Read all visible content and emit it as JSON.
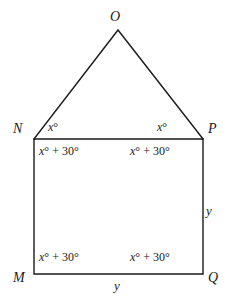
{
  "figure": {
    "type": "geometry-diagram",
    "canvas": {
      "width": 230,
      "height": 302
    },
    "stroke_color": "#1a1a1a",
    "fill_color": "#ffffff",
    "stroke_width": 1.4,
    "points": {
      "O": {
        "x": 118,
        "y": 30
      },
      "N": {
        "x": 34,
        "y": 139
      },
      "P": {
        "x": 203,
        "y": 139
      },
      "Q": {
        "x": 203,
        "y": 274
      },
      "M": {
        "x": 34,
        "y": 274
      }
    },
    "vertex_labels": {
      "O": "O",
      "N": "N",
      "P": "P",
      "M": "M",
      "Q": "Q"
    },
    "angle_labels": {
      "triangle_base_left": {
        "var": "x",
        "deg": "°"
      },
      "triangle_base_right": {
        "var": "x",
        "deg": "°"
      },
      "rect_top_left": {
        "var": "x",
        "rest": "° + 30°"
      },
      "rect_top_right": {
        "var": "x",
        "rest": "° + 30°"
      },
      "rect_bottom_left": {
        "var": "x",
        "rest": "° + 30°"
      },
      "rect_bottom_right": {
        "var": "x",
        "rest": "° + 30°"
      }
    },
    "side_labels": {
      "right_side": "y",
      "bottom_side": "y"
    }
  }
}
